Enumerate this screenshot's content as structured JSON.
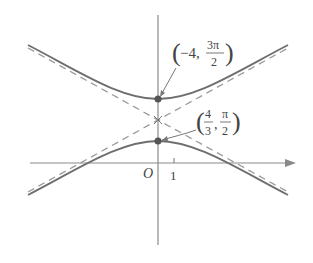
{
  "figure": {
    "origin_label": "O",
    "x_tick_label": "1",
    "upper_point": {
      "paren_open": "(",
      "x": "−4,",
      "num": "3π",
      "den": "2",
      "paren_close": ")"
    },
    "lower_point": {
      "paren_open": "(",
      "x_num": "4",
      "x_den": "3",
      "comma": ",",
      "num": "π",
      "den": "2",
      "paren_close": ")"
    },
    "colors": {
      "curve": "#6e6e6e",
      "asymptote": "#9a9a9a",
      "axis": "#8a8a8a",
      "point": "#555555"
    }
  }
}
